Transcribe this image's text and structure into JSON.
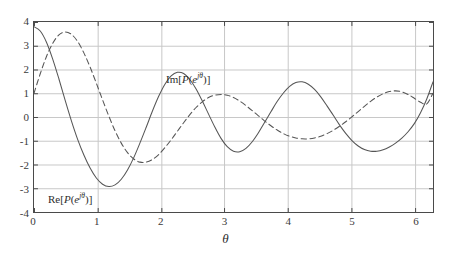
{
  "figure": {
    "background": "#ffffff",
    "axes_color": "#4a4a4a",
    "grid_color": "#c8c8c8",
    "curve_color": "#555555"
  },
  "axis": {
    "xlabel": "θ",
    "ylabel": "",
    "x_ticks": [
      "0",
      "1",
      "2",
      "3",
      "4",
      "5",
      "6"
    ],
    "x_tick_values": [
      0,
      1,
      2,
      3,
      4,
      5,
      6
    ],
    "y_ticks": [
      "4",
      "3",
      "2",
      "1",
      "0",
      "-1",
      "-2",
      "-3",
      "-4"
    ],
    "y_tick_values": [
      4,
      3,
      2,
      1,
      0,
      -1,
      -2,
      -3,
      -4
    ],
    "xlim": [
      0,
      6.283185
    ],
    "ylim": [
      -4,
      4
    ],
    "grid": true
  },
  "annotations": {
    "im_label": {
      "prefix": "Im[",
      "p": "P",
      "open": "(",
      "e": "e",
      "exp": "jθ",
      "close": ")]",
      "text": "Im[P(e^{jθ})]",
      "x": 2.09,
      "y": 1.55
    },
    "re_label": {
      "prefix": "Re[",
      "p": "P",
      "open": "(",
      "e": "e",
      "exp": "jθ",
      "close": ")]",
      "text": "Re[P(e^{jθ})]",
      "x": 0.39,
      "y": -3.28
    }
  },
  "chart_data": {
    "type": "line",
    "title": "",
    "xlabel": "θ",
    "ylabel": "",
    "xlim": [
      0,
      6.283185
    ],
    "ylim": [
      -4,
      4
    ],
    "grid": true,
    "legend_position": "inline-annotations",
    "x": [
      0.0,
      0.0982,
      0.1963,
      0.2945,
      0.3927,
      0.4909,
      0.589,
      0.6872,
      0.7854,
      0.8836,
      0.9817,
      1.0799,
      1.1781,
      1.2763,
      1.3744,
      1.4726,
      1.5708,
      1.669,
      1.7671,
      1.8653,
      1.9635,
      2.0617,
      2.1598,
      2.258,
      2.3562,
      2.4544,
      2.5525,
      2.6507,
      2.7489,
      2.8471,
      2.9452,
      3.0434,
      3.1416,
      3.2398,
      3.3379,
      3.4361,
      3.5343,
      3.6325,
      3.7306,
      3.8288,
      3.927,
      4.0252,
      4.1233,
      4.2215,
      4.3197,
      4.4179,
      4.516,
      4.6142,
      4.7124,
      4.8106,
      4.9087,
      5.0069,
      5.1051,
      5.2033,
      5.3014,
      5.3996,
      5.4978,
      5.596,
      5.6941,
      5.7923,
      5.8905,
      5.9887,
      6.0868,
      6.185,
      6.2832
    ],
    "series": [
      {
        "name": "Re[P(e^{jθ})]",
        "style": "solid",
        "color": "#555555",
        "values": [
          3.8,
          3.62,
          3.15,
          2.44,
          1.6,
          0.7,
          -0.16,
          -0.94,
          -1.6,
          -2.15,
          -2.57,
          -2.83,
          -2.93,
          -2.86,
          -2.62,
          -2.23,
          -1.71,
          -1.09,
          -0.43,
          0.25,
          0.87,
          1.38,
          1.73,
          1.88,
          1.83,
          1.58,
          1.18,
          0.67,
          0.12,
          -0.42,
          -0.9,
          -1.25,
          -1.44,
          -1.46,
          -1.32,
          -1.04,
          -0.66,
          -0.22,
          0.22,
          0.65,
          1.01,
          1.29,
          1.45,
          1.48,
          1.38,
          1.16,
          0.85,
          0.47,
          0.07,
          -0.33,
          -0.69,
          -0.99,
          -1.22,
          -1.37,
          -1.44,
          -1.44,
          -1.38,
          -1.26,
          -1.1,
          -0.89,
          -0.62,
          -0.28,
          0.18,
          0.76,
          1.48
        ]
      },
      {
        "name": "Im[P(e^{jθ})]",
        "style": "dashed",
        "color": "#555555",
        "values": [
          1.0,
          1.82,
          2.55,
          3.1,
          3.46,
          3.58,
          3.48,
          3.18,
          2.7,
          2.1,
          1.42,
          0.72,
          0.04,
          -0.58,
          -1.1,
          -1.5,
          -1.77,
          -1.9,
          -1.9,
          -1.79,
          -1.58,
          -1.29,
          -0.96,
          -0.6,
          -0.24,
          0.1,
          0.4,
          0.64,
          0.82,
          0.92,
          0.95,
          0.92,
          0.82,
          0.67,
          0.48,
          0.27,
          0.05,
          -0.17,
          -0.37,
          -0.55,
          -0.7,
          -0.81,
          -0.88,
          -0.92,
          -0.92,
          -0.88,
          -0.81,
          -0.7,
          -0.56,
          -0.39,
          -0.2,
          0.01,
          0.23,
          0.45,
          0.66,
          0.84,
          0.98,
          1.07,
          1.1,
          1.06,
          0.95,
          0.79,
          0.62,
          0.55,
          1.0
        ]
      }
    ],
    "note_series_actual": {
      "description": "Values rendered from closed form of a 10th-order polynomial evaluated on the unit circle",
      "re_extrema": [
        {
          "theta": 0.0,
          "value": 3.8
        },
        {
          "theta": 0.73,
          "value": -2.93
        },
        {
          "theta": 1.45,
          "value": 1.88
        },
        {
          "theta": 2.17,
          "value": -1.46
        },
        {
          "theta": 3.14,
          "value": 1.1
        },
        {
          "theta": 4.11,
          "value": -1.48
        },
        {
          "theta": 4.82,
          "value": 1.84
        },
        {
          "theta": 5.55,
          "value": -2.93
        },
        {
          "theta": 6.283,
          "value": 3.8
        }
      ],
      "im_extrema": [
        {
          "theta": 0.0,
          "value": 1.0
        },
        {
          "theta": 0.36,
          "value": 3.6
        },
        {
          "theta": 1.12,
          "value": -2.3
        },
        {
          "theta": 1.97,
          "value": 1.6
        },
        {
          "theta": 2.62,
          "value": -1.33
        },
        {
          "theta": 3.7,
          "value": 1.42
        },
        {
          "theta": 4.5,
          "value": -1.62
        },
        {
          "theta": 5.18,
          "value": 2.29
        },
        {
          "theta": 5.92,
          "value": -3.48
        },
        {
          "theta": 6.283,
          "value": 1.0
        }
      ]
    }
  }
}
